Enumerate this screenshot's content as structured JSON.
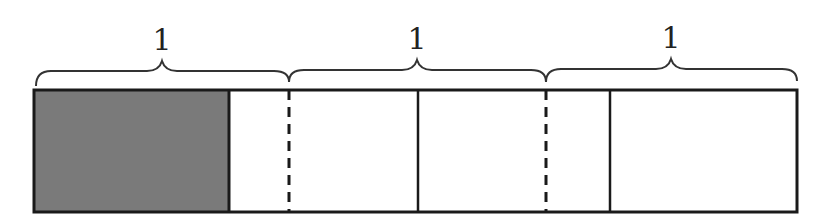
{
  "diagram": {
    "type": "tape-diagram",
    "bar": {
      "x": 34,
      "y": 90,
      "width": 763,
      "height": 122
    },
    "braces": [
      {
        "label": "1",
        "x1": 34,
        "x2": 289
      },
      {
        "label": "1",
        "x1": 289,
        "x2": 546
      },
      {
        "label": "1",
        "x1": 546,
        "x2": 797
      }
    ],
    "shaded_section": {
      "x1": 34,
      "x2": 229,
      "color": "#7a7a7a"
    },
    "dividers": [
      {
        "x": 229,
        "style": "solid"
      },
      {
        "x": 289,
        "style": "dashed"
      },
      {
        "x": 418,
        "style": "solid"
      },
      {
        "x": 546,
        "style": "dashed"
      },
      {
        "x": 610,
        "style": "solid"
      }
    ],
    "colors": {
      "stroke": "#1a1a1a",
      "shade": "#7a7a7a",
      "background": "#ffffff"
    }
  }
}
